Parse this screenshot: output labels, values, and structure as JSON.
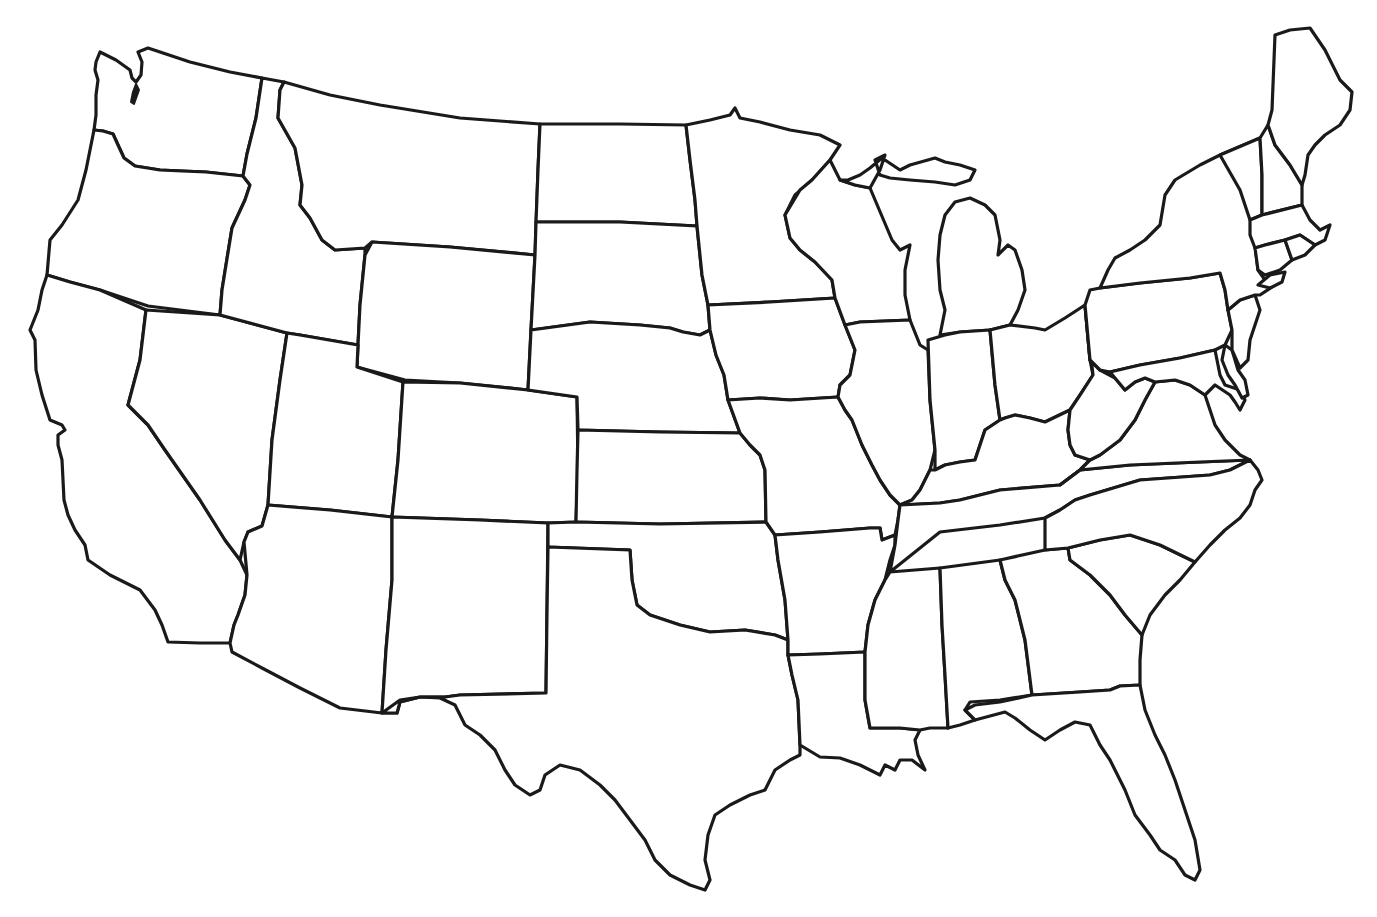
{
  "map": {
    "title": "",
    "type": "blank outline map",
    "region": "contiguous United States",
    "style": "hand-drawn black outlines on white",
    "labels": [],
    "colors": {
      "background": "#ffffff",
      "outline": "#1a1a1a"
    },
    "states": [
      "washington",
      "oregon",
      "california",
      "idaho",
      "nevada",
      "montana",
      "wyoming",
      "utah",
      "arizona",
      "colorado",
      "new-mexico",
      "north-dakota",
      "south-dakota",
      "nebraska",
      "kansas",
      "oklahoma",
      "texas",
      "minnesota",
      "iowa",
      "missouri",
      "arkansas",
      "louisiana",
      "wisconsin",
      "illinois",
      "michigan",
      "indiana",
      "kentucky",
      "tennessee",
      "mississippi",
      "alabama",
      "georgia",
      "florida",
      "ohio",
      "west-virginia",
      "virginia",
      "north-carolina",
      "south-carolina",
      "pennsylvania",
      "new-york",
      "maryland",
      "delaware",
      "new-jersey",
      "vermont",
      "new-hampshire",
      "maine",
      "massachusetts",
      "connecticut",
      "rhode-island"
    ]
  }
}
